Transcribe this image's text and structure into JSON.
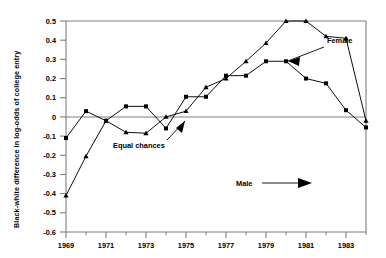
{
  "chart_data": {
    "type": "line",
    "title": "",
    "xlabel": "",
    "ylabel": "Black-white difference in log-odds of college entry",
    "xlim": [
      1969,
      1984
    ],
    "ylim": [
      -0.6,
      0.5
    ],
    "grid": false,
    "legend_position": "annotations-inline",
    "yticks": [
      "0.5",
      "0.4",
      "0.3",
      "0.2",
      "0.1",
      "0",
      "-0.1",
      "-0.2",
      "-0.3",
      "-0.4",
      "-0.5",
      "-0.6"
    ],
    "ytick_values": [
      0.5,
      0.4,
      0.3,
      0.2,
      0.1,
      0,
      -0.1,
      -0.2,
      -0.3,
      -0.4,
      -0.5,
      -0.6
    ],
    "xticks": [
      "1969",
      "1971",
      "1973",
      "1975",
      "1977",
      "1979",
      "1981",
      "1983"
    ],
    "xtick_values": [
      1969,
      1971,
      1973,
      1975,
      1977,
      1979,
      1981,
      1983
    ],
    "xminor_values": [
      1970,
      1972,
      1974,
      1976,
      1978,
      1980,
      1982,
      1984
    ],
    "reference_line": {
      "value": 0,
      "label": "Equal chances"
    },
    "x": [
      1969,
      1970,
      1971,
      1972,
      1973,
      1974,
      1975,
      1976,
      1977,
      1978,
      1979,
      1980,
      1981,
      1982,
      1983,
      1984
    ],
    "series": [
      {
        "name": "Female",
        "marker": "square",
        "values": [
          -0.11,
          0.03,
          -0.02,
          0.055,
          0.055,
          -0.06,
          0.105,
          0.105,
          0.215,
          0.215,
          0.29,
          0.29,
          0.2,
          0.175,
          0.035,
          -0.055
        ]
      },
      {
        "name": "Male",
        "marker": "triangle",
        "values": [
          -0.41,
          -0.205,
          -0.02,
          -0.08,
          -0.085,
          0.0,
          0.03,
          0.155,
          0.2,
          0.29,
          0.385,
          0.5,
          0.5,
          0.42,
          0.41,
          -0.02
        ]
      }
    ],
    "annotations": [
      {
        "label": "Female",
        "arrow": "left-down"
      },
      {
        "label": "Equal chances",
        "arrow": "up-right"
      },
      {
        "label": "Male",
        "arrow": "right"
      }
    ],
    "colors": {
      "line": "#000000",
      "axis": "#808080",
      "background": "#ffffff"
    }
  }
}
